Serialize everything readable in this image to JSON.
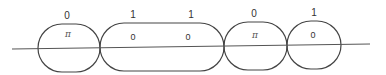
{
  "diagram": {
    "type": "chain-of-segments-on-line",
    "line": {
      "x1": 12,
      "y1": 49,
      "x2": 370,
      "y2": 44,
      "color": "#555555"
    },
    "segments": [
      {
        "id": "seg-1",
        "shape": "circle",
        "x": 38,
        "y": 24,
        "w": 62,
        "h": 48,
        "rx": 24,
        "top_labels": [
          {
            "text": "0",
            "x": 67,
            "y": 19
          }
        ],
        "inner_labels": [
          {
            "text": "π",
            "x": 68,
            "y": 37,
            "kind": "pi"
          }
        ]
      },
      {
        "id": "seg-2",
        "shape": "pill",
        "x": 100,
        "y": 23,
        "w": 124,
        "h": 48,
        "rx": 24,
        "top_labels": [
          {
            "text": "1",
            "x": 133,
            "y": 18
          },
          {
            "text": "1",
            "x": 191,
            "y": 18
          }
        ],
        "inner_labels": [
          {
            "text": "0",
            "x": 133,
            "y": 40,
            "kind": "num"
          },
          {
            "text": "0",
            "x": 188,
            "y": 40,
            "kind": "num"
          }
        ]
      },
      {
        "id": "seg-3",
        "shape": "circle",
        "x": 224,
        "y": 22,
        "w": 63,
        "h": 48,
        "rx": 24,
        "top_labels": [
          {
            "text": "0",
            "x": 254,
            "y": 17
          }
        ],
        "inner_labels": [
          {
            "text": "π",
            "x": 255,
            "y": 38,
            "kind": "pi"
          }
        ]
      },
      {
        "id": "seg-4",
        "shape": "circle",
        "x": 287,
        "y": 21,
        "w": 54,
        "h": 48,
        "rx": 24,
        "top_labels": [
          {
            "text": "1",
            "x": 314,
            "y": 16
          }
        ],
        "inner_labels": [
          {
            "text": "0",
            "x": 313,
            "y": 38,
            "kind": "num"
          }
        ]
      }
    ],
    "stroke_color": "#444444"
  },
  "labels": {
    "top": [
      "0",
      "1",
      "1",
      "0",
      "1"
    ],
    "inner": [
      "π",
      "0",
      "0",
      "π",
      "0"
    ]
  }
}
